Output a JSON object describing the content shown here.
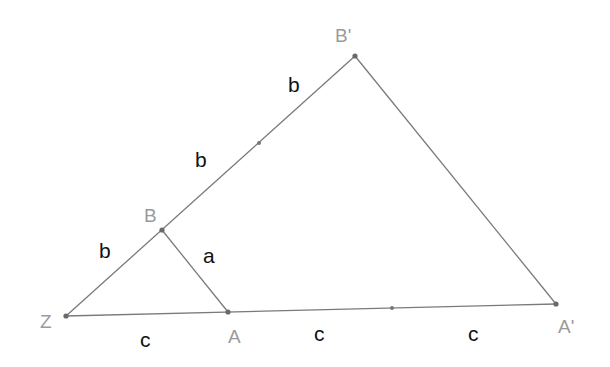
{
  "diagram": {
    "type": "similar-triangles-construction",
    "points": {
      "Z": {
        "label": "Z",
        "x": 66,
        "y": 316
      },
      "B": {
        "label": "B",
        "x": 162,
        "y": 230
      },
      "A": {
        "label": "A",
        "x": 228,
        "y": 312
      },
      "B_prime": {
        "label": "B'",
        "x": 355,
        "y": 56
      },
      "A_prime": {
        "label": "A'",
        "x": 556,
        "y": 304
      }
    },
    "midpoints": [
      {
        "on": "B-B'",
        "x": 259,
        "y": 143
      },
      {
        "on": "A-A'",
        "x": 392,
        "y": 308
      }
    ],
    "segment_labels": [
      {
        "name": "ZB",
        "text": "b"
      },
      {
        "name": "BM1",
        "text": "b"
      },
      {
        "name": "M1B'",
        "text": "b"
      },
      {
        "name": "BA",
        "text": "a"
      },
      {
        "name": "ZA",
        "text": "c"
      },
      {
        "name": "AM2",
        "text": "c"
      },
      {
        "name": "M2A'",
        "text": "c"
      }
    ],
    "colors": {
      "line": "#7a7a7a",
      "point": "#6a6a6a",
      "vertex_label": "#9a9a9a",
      "segment_label": "#111111"
    }
  }
}
